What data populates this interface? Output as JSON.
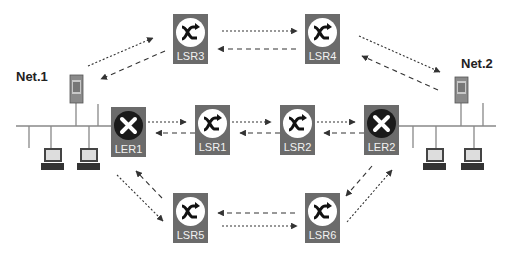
{
  "diagram": {
    "title": "",
    "networks": [
      {
        "id": "net1",
        "label": "Net.1"
      },
      {
        "id": "net2",
        "label": "Net.2"
      }
    ],
    "nodes": [
      {
        "id": "LSR3",
        "label": "LSR3",
        "type": "lsr"
      },
      {
        "id": "LSR4",
        "label": "LSR4",
        "type": "lsr"
      },
      {
        "id": "LER1",
        "label": "LER1",
        "type": "ler"
      },
      {
        "id": "LSR1",
        "label": "LSR1",
        "type": "lsr"
      },
      {
        "id": "LSR2",
        "label": "LSR2",
        "type": "lsr"
      },
      {
        "id": "LER2",
        "label": "LER2",
        "type": "ler"
      },
      {
        "id": "LSR5",
        "label": "LSR5",
        "type": "lsr"
      },
      {
        "id": "LSR6",
        "label": "LSR6",
        "type": "lsr"
      }
    ],
    "links": [
      {
        "from": "Net.1",
        "to": "LSR3",
        "style": "dotted"
      },
      {
        "from": "LSR3",
        "to": "Net.1",
        "style": "dashed"
      },
      {
        "from": "LSR3",
        "to": "LSR4",
        "style": "dotted"
      },
      {
        "from": "LSR4",
        "to": "LSR3",
        "style": "dashed"
      },
      {
        "from": "LSR4",
        "to": "Net.2",
        "style": "dotted"
      },
      {
        "from": "Net.2",
        "to": "LSR4",
        "style": "dashed"
      },
      {
        "from": "LER1",
        "to": "LSR1",
        "style": "dotted"
      },
      {
        "from": "LSR1",
        "to": "LER1",
        "style": "dashed"
      },
      {
        "from": "LSR1",
        "to": "LSR2",
        "style": "dotted"
      },
      {
        "from": "LSR2",
        "to": "LSR1",
        "style": "dashed"
      },
      {
        "from": "LSR2",
        "to": "LER2",
        "style": "dotted"
      },
      {
        "from": "LER2",
        "to": "LSR2",
        "style": "dashed"
      },
      {
        "from": "LER1",
        "to": "LSR5",
        "style": "dotted"
      },
      {
        "from": "LSR5",
        "to": "LER1",
        "style": "dashed"
      },
      {
        "from": "LSR5",
        "to": "LSR6",
        "style": "dotted"
      },
      {
        "from": "LSR6",
        "to": "LSR5",
        "style": "dashed"
      },
      {
        "from": "LSR6",
        "to": "LER2",
        "style": "dotted"
      },
      {
        "from": "LER2",
        "to": "LSR6",
        "style": "dashed"
      }
    ],
    "hosts": {
      "net1": {
        "servers": 1,
        "workstations": 2
      },
      "net2": {
        "servers": 1,
        "workstations": 2
      }
    },
    "colors": {
      "node_box": "#6b6b6b",
      "lsr_disc": "#ffffff",
      "ler_disc": "#1a1a1a",
      "node_label": "#f2f2f2",
      "link": "#333333",
      "lan": "#888888"
    }
  }
}
